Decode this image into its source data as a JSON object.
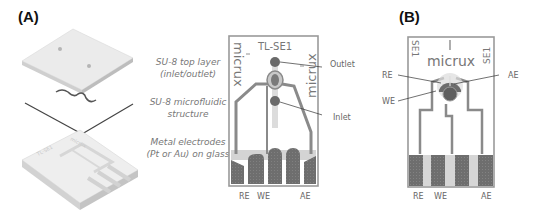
{
  "panels": {
    "a": {
      "label": "(A)",
      "layers": [
        {
          "line1": "SU-8 top layer",
          "line2": "(inlet/outlet)"
        },
        {
          "line1": "SU-8 microfluidic",
          "line2": "structure"
        },
        {
          "line1": "Metal electrodes",
          "line2": "(Pt or Au) on glass"
        }
      ],
      "chip": {
        "title": "TL-SE1",
        "brand_left": "micrux",
        "brand_right": "micrux",
        "callouts": {
          "outlet": "Outlet",
          "inlet": "Inlet"
        },
        "electrode_labels": {
          "re": "RE",
          "we": "WE",
          "ae": "AE"
        }
      }
    },
    "b": {
      "label": "(B)",
      "chip": {
        "brand": "micrux",
        "side_left": "SE1",
        "side_right": "SE1",
        "callouts": {
          "re": "RE",
          "we": "WE",
          "ae": "AE"
        },
        "electrode_labels": {
          "re": "RE",
          "we": "WE",
          "ae": "AE"
        }
      }
    }
  },
  "colors": {
    "electrode_dark": "#6e6e6e",
    "trace": "#8a8a8a",
    "channel_light": "#d4d4d4",
    "border": "#9a9a9a",
    "text": "#666666"
  }
}
